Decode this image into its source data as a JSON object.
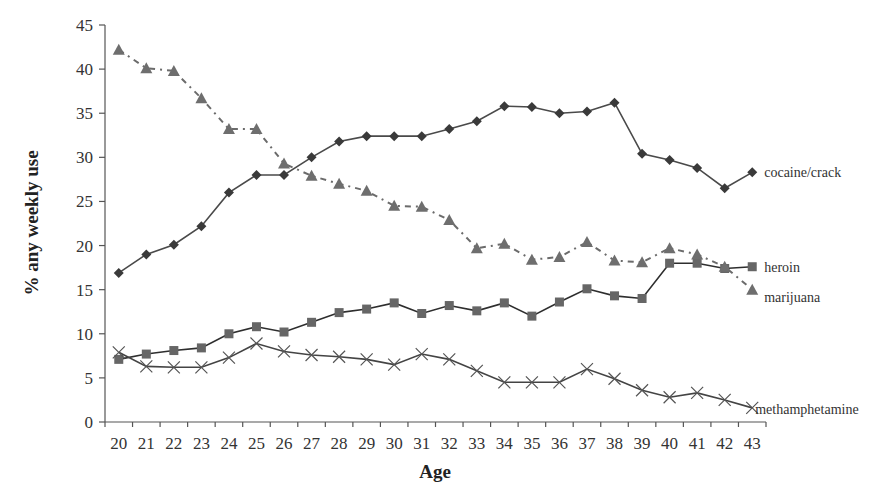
{
  "chart_data": {
    "type": "line",
    "title": "",
    "xlabel": "Age",
    "ylabel": "% any weekly use",
    "ylim": [
      0,
      45
    ],
    "yticks": [
      0,
      5,
      10,
      15,
      20,
      25,
      30,
      35,
      40,
      45
    ],
    "grid": false,
    "legend": "inline-right",
    "x": [
      20,
      21,
      22,
      23,
      24,
      25,
      26,
      27,
      28,
      29,
      30,
      31,
      32,
      33,
      34,
      35,
      36,
      37,
      38,
      39,
      40,
      41,
      42,
      43
    ],
    "series": [
      {
        "name": "cocaine/crack",
        "marker": "diamond",
        "line_style": "solid",
        "color": "#4a4a4a",
        "values": [
          16.9,
          19.0,
          20.1,
          22.2,
          26.0,
          28.0,
          28.0,
          30.0,
          31.8,
          32.4,
          32.4,
          32.4,
          33.2,
          34.1,
          35.8,
          35.7,
          35.0,
          35.2,
          36.2,
          30.4,
          29.7,
          28.8,
          26.5,
          28.3
        ]
      },
      {
        "name": "heroin",
        "marker": "square",
        "line_style": "solid",
        "color": "#2e2e2e",
        "values": [
          7.1,
          7.7,
          8.1,
          8.4,
          10.0,
          10.8,
          10.2,
          11.3,
          12.4,
          12.8,
          13.5,
          12.3,
          13.2,
          12.6,
          13.5,
          12.0,
          13.6,
          15.1,
          14.3,
          14.0,
          18.0,
          18.0,
          17.4,
          17.6
        ]
      },
      {
        "name": "marijuana",
        "marker": "triangle",
        "line_style": "dash-dot",
        "color": "#6b6b6b",
        "values": [
          42.2,
          40.1,
          39.8,
          36.7,
          33.2,
          33.2,
          29.3,
          27.9,
          27.0,
          26.2,
          24.5,
          24.4,
          22.9,
          19.7,
          20.2,
          18.4,
          18.7,
          20.4,
          18.3,
          18.1,
          19.7,
          19.0,
          17.6,
          15.0
        ]
      },
      {
        "name": "methamphetamine",
        "marker": "x",
        "line_style": "solid",
        "color": "#444444",
        "values": [
          7.9,
          6.3,
          6.2,
          6.2,
          7.3,
          8.9,
          8.0,
          7.6,
          7.4,
          7.1,
          6.5,
          7.7,
          7.1,
          5.8,
          4.5,
          4.5,
          4.5,
          6.0,
          4.9,
          3.6,
          2.8,
          3.3,
          2.5,
          1.6
        ]
      }
    ]
  }
}
